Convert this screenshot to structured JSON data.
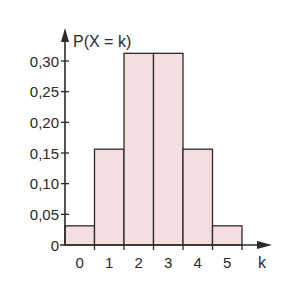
{
  "chart_data": {
    "type": "bar",
    "title": "",
    "xlabel": "k",
    "ylabel": "P(X = k)",
    "categories": [
      "0",
      "1",
      "2",
      "3",
      "4",
      "5"
    ],
    "values": [
      0.03125,
      0.15625,
      0.3125,
      0.3125,
      0.15625,
      0.03125
    ],
    "yticks": [
      "0",
      "0,05",
      "0,10",
      "0,15",
      "0,20",
      "0,25",
      "0,30"
    ],
    "ytick_values": [
      0,
      0.05,
      0.1,
      0.15,
      0.2,
      0.25,
      0.3
    ],
    "ylim": [
      0,
      0.33
    ],
    "grid": false,
    "legend": null,
    "bar_fill": "#f6dde0",
    "bar_stroke": "#2a2a2a",
    "bar_width": "full (histogram, adjacent bars)"
  }
}
